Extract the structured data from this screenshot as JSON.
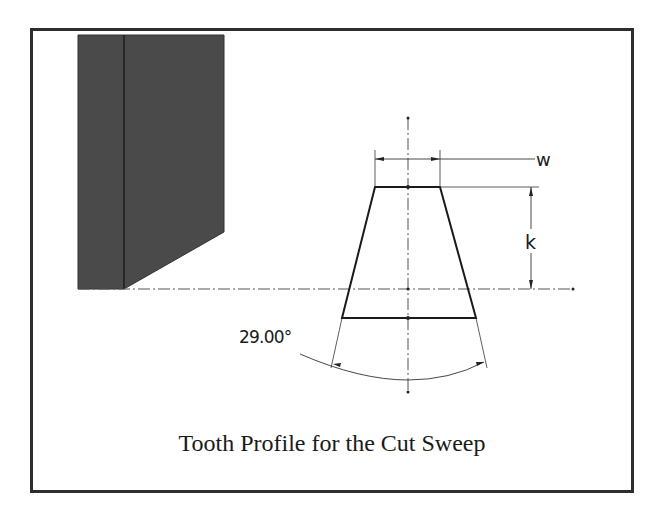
{
  "figure": {
    "caption": "Tooth Profile for the Cut Sweep",
    "colors": {
      "border": "#2e2e2e",
      "blank_fill": "#4a4a4a",
      "line": "#1a1a1a",
      "construction_line": "#555555"
    }
  },
  "dimensions": {
    "width_label": "w",
    "height_label": "k",
    "angle_label": "29.00°"
  }
}
